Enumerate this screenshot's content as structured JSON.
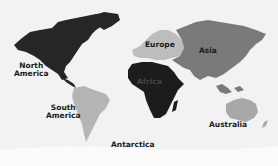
{
  "map": {
    "title": "World continents map",
    "colors": {
      "ocean": "#f2f2f2",
      "north_america": "#262626",
      "south_america": "#b5b5b5",
      "europe": "#bdbdbd",
      "asia": "#7a7a7a",
      "africa": "#1c1c1c",
      "australia": "#a8a8a8",
      "antarctica": "#fafafa"
    },
    "labels": {
      "north_america_1": "North",
      "north_america_2": "America",
      "south_america_1": "South",
      "south_america_2": "America",
      "europe": "Europe",
      "asia": "Asia",
      "africa": "Africa",
      "australia": "Australia",
      "antarctica": "Antarctica"
    }
  }
}
